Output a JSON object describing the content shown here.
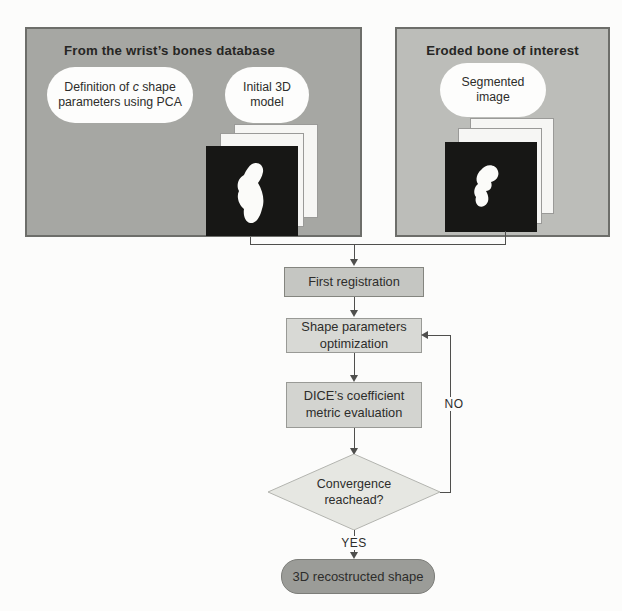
{
  "panels": {
    "database": {
      "title": "From the wrist’s bones database",
      "ellipse_pca": {
        "part1": "Definition of ",
        "italic_var": "c",
        "part2": " shape parameters using PCA"
      },
      "ellipse_model": "Initial 3D model",
      "stack_icon": "bone-slice-stack"
    },
    "eroded": {
      "title": "Eroded bone of interest",
      "ellipse_segmented": "Segmented image",
      "stack_icon": "bone-slice-stack"
    }
  },
  "flow": {
    "first_registration": "First registration",
    "shape_optimization": "Shape parameters optimization",
    "dice_evaluation": "DICE’s coefficient metric evaluation",
    "decision": "Convergence reachead?",
    "result": "3D recostructed shape",
    "label_yes": "YES",
    "label_no": "NO"
  },
  "colors": {
    "page_bg": "#fcfcfb",
    "panel_left_bg": "#a6a7a3",
    "panel_right_bg": "#bcbdb9",
    "panel_border": "#6d6e6a",
    "ellipse_bg": "#fdfdfc",
    "sheet_bg": "#f6f6f4",
    "sheet_border": "#9a9a98",
    "slice_bg": "#171715",
    "bone_fill": "#fbfbf9",
    "node_first_bg": "#c5c6c2",
    "node_first_border": "#84857f",
    "node_light_bg": "#d8d9d5",
    "node_light_border": "#999a96",
    "dice_bg": "#d3d4d0",
    "diamond_bg": "#e6e7e2",
    "diamond_border": "#b3b4af",
    "pill_bg": "#9b9c98",
    "pill_border": "#7c7d79",
    "line": "#4f4f4d",
    "text": "#2d2d2b",
    "title_text": "#262624"
  }
}
